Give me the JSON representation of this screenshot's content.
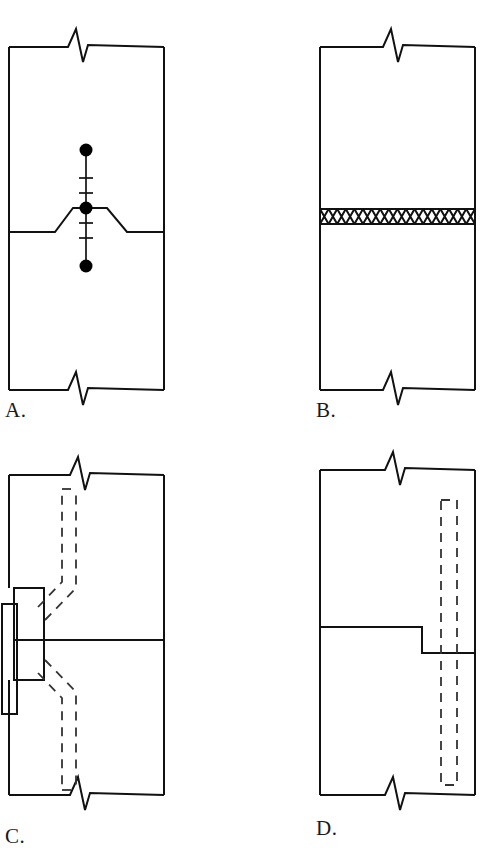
{
  "figure": {
    "kind": "technical-detail-sheet",
    "background_color": "#ffffff",
    "line_color": "#111111",
    "dashed_line_color": "#333333"
  },
  "panels": [
    {
      "id": "A",
      "label": "A.",
      "detail_name": "keyed joint with dowel and tick-marked centerline",
      "box": {
        "x": 9,
        "y": 47,
        "width": 155,
        "height": 343
      },
      "break_symbols": [
        "top",
        "bottom"
      ],
      "joint_line": {
        "type": "trapezoid-bump",
        "base_y": 232,
        "top_y": 208,
        "left_start_x": 9,
        "ramp_left_start_x": 55,
        "flat_left_x": 73,
        "flat_right_x": 107,
        "ramp_right_end_x": 127,
        "right_end_x": 164
      },
      "centerline": {
        "x": 86,
        "top_y": 150,
        "bottom_y": 266,
        "tick_count": 4,
        "tick_half_width": 7,
        "tick_y_values": [
          178,
          193,
          223,
          238
        ],
        "dot_radius": 6.5,
        "dot_y_values": [
          150,
          208,
          266
        ]
      }
    },
    {
      "id": "B",
      "label": "B.",
      "detail_name": "horizontal joint with compressible crosshatch gasket filler",
      "box": {
        "x": 320,
        "y": 47,
        "width": 155,
        "height": 343
      },
      "break_symbols": [
        "top",
        "bottom"
      ],
      "gasket_band": {
        "top_y": 209,
        "bottom_y": 224,
        "pattern": "crosshatch-x",
        "cell_count": 18
      }
    },
    {
      "id": "C",
      "label": "C.",
      "detail_name": "plate-anchored joint with bent dashed conduit both sides",
      "label_clipped": true,
      "box": {
        "x": 9,
        "y": 475,
        "width": 155,
        "height": 320
      },
      "break_symbols": [
        "top",
        "bottom"
      ],
      "joint_line": {
        "type": "straight",
        "y": 640
      },
      "plates": [
        {
          "name": "inner-plate",
          "x": 14,
          "y": 588,
          "width": 30,
          "height": 92
        },
        {
          "name": "outer-plate",
          "x": 2,
          "y": 604,
          "width": 15,
          "height": 110
        }
      ],
      "dashed_conduits": [
        {
          "name": "upper-conduit",
          "path_points": [
            [
              62,
              607
            ],
            [
              62,
              577
            ],
            [
              69,
              566
            ],
            [
              69,
              489
            ],
            [
              86,
              489
            ],
            [
              86,
              572
            ],
            [
              76,
              588
            ],
            [
              45,
              620
            ]
          ]
        },
        {
          "name": "lower-conduit",
          "path_points": [
            [
              45,
              660
            ],
            [
              76,
              692
            ],
            [
              86,
              708
            ],
            [
              86,
              790
            ],
            [
              69,
              790
            ],
            [
              69,
              714
            ],
            [
              62,
              703
            ],
            [
              62,
              673
            ]
          ]
        }
      ]
    },
    {
      "id": "D",
      "label": "D.",
      "detail_name": "stepped shiplap joint with full-height hidden dowel",
      "box": {
        "x": 320,
        "y": 470,
        "width": 155,
        "height": 325
      },
      "break_symbols": [
        "top",
        "bottom"
      ],
      "joint_line": {
        "type": "stepped",
        "upper_y": 627,
        "lower_y": 653,
        "step_x": 422,
        "left_start_x": 320,
        "right_end_x": 475
      },
      "hidden_dowel": {
        "shape": "dashed-rectangle",
        "x": 441,
        "y": 500,
        "width": 16,
        "height": 285
      }
    }
  ]
}
